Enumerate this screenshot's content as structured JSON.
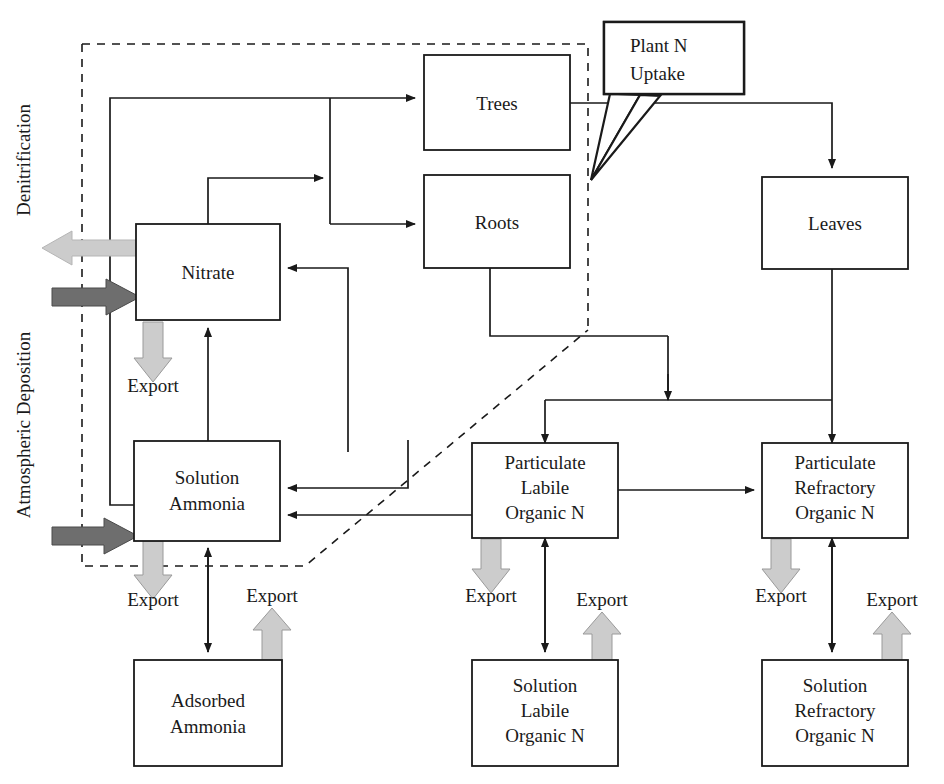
{
  "diagram": {
    "colors": {
      "line": "#1a1a1a",
      "box_fill": "#ffffff",
      "export_arrow": "#cccccc",
      "export_arrow_stroke": "#9a9a9a",
      "deposition_arrow": "#6e6e6e",
      "denitrification_arrow": "#c9c9c9",
      "dashed_boundary": "#1a1a1a",
      "background": "#ffffff"
    },
    "side_labels": [
      {
        "id": "denitrification",
        "text": "Denitrification",
        "orientation": "vertical"
      },
      {
        "id": "atmospheric-deposition",
        "text": "Atmospheric Deposition",
        "orientation": "vertical"
      }
    ],
    "callout": {
      "id": "plant-n-uptake",
      "line1": "Plant N",
      "line2": "Uptake"
    },
    "boxes": [
      {
        "id": "nitrate",
        "lines": [
          "Nitrate"
        ]
      },
      {
        "id": "solution-ammonia",
        "lines": [
          "Solution",
          "Ammonia"
        ]
      },
      {
        "id": "adsorbed-ammonia",
        "lines": [
          "Adsorbed",
          "Ammonia"
        ]
      },
      {
        "id": "trees",
        "lines": [
          "Trees"
        ]
      },
      {
        "id": "roots",
        "lines": [
          "Roots"
        ]
      },
      {
        "id": "leaves",
        "lines": [
          "Leaves"
        ]
      },
      {
        "id": "particulate-labile",
        "lines": [
          "Particulate",
          "Labile",
          "Organic N"
        ]
      },
      {
        "id": "particulate-refractory",
        "lines": [
          "Particulate",
          "Refractory",
          "Organic N"
        ]
      },
      {
        "id": "solution-labile",
        "lines": [
          "Solution",
          "Labile",
          "Organic N"
        ]
      },
      {
        "id": "solution-refractory",
        "lines": [
          "Solution",
          "Refractory",
          "Organic N"
        ]
      }
    ],
    "export_labels": [
      {
        "id": "export-nitrate",
        "text": "Export"
      },
      {
        "id": "export-solution-ammonia",
        "text": "Export"
      },
      {
        "id": "export-adsorbed-ammonia",
        "text": "Export"
      },
      {
        "id": "export-particulate-labile",
        "text": "Export"
      },
      {
        "id": "export-solution-labile",
        "text": "Export"
      },
      {
        "id": "export-particulate-refractory",
        "text": "Export"
      },
      {
        "id": "export-solution-refractory",
        "text": "Export"
      }
    ]
  }
}
